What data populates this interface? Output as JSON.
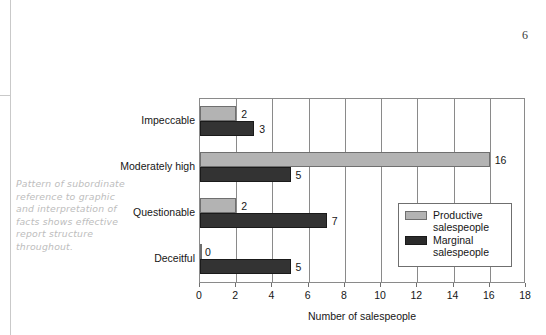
{
  "page": {
    "folio": "6",
    "margin_note": "Pattern of subordinate reference to graphic and interpretation of facts shows effective report structure throughout."
  },
  "chart_data": {
    "type": "bar",
    "orientation": "horizontal",
    "title": "",
    "xlabel": "Number of salespeople",
    "ylabel": "",
    "xlim": [
      0,
      18
    ],
    "xticks": [
      "0",
      "2",
      "4",
      "6",
      "8",
      "10",
      "12",
      "14",
      "16",
      "18"
    ],
    "grid": "vertical",
    "legend_position": "inside-right",
    "categories": [
      "Impeccable",
      "Moderately high",
      "Questionable",
      "Deceitful"
    ],
    "series": [
      {
        "name": "Productive salespeople",
        "color": "#b3b3b3",
        "values": [
          2,
          16,
          2,
          0
        ],
        "labels": [
          "2",
          "16",
          "2",
          "0"
        ]
      },
      {
        "name": "Marginal salespeople",
        "color": "#333333",
        "values": [
          3,
          5,
          7,
          5
        ],
        "labels": [
          "3",
          "5",
          "7",
          "5"
        ]
      }
    ]
  }
}
